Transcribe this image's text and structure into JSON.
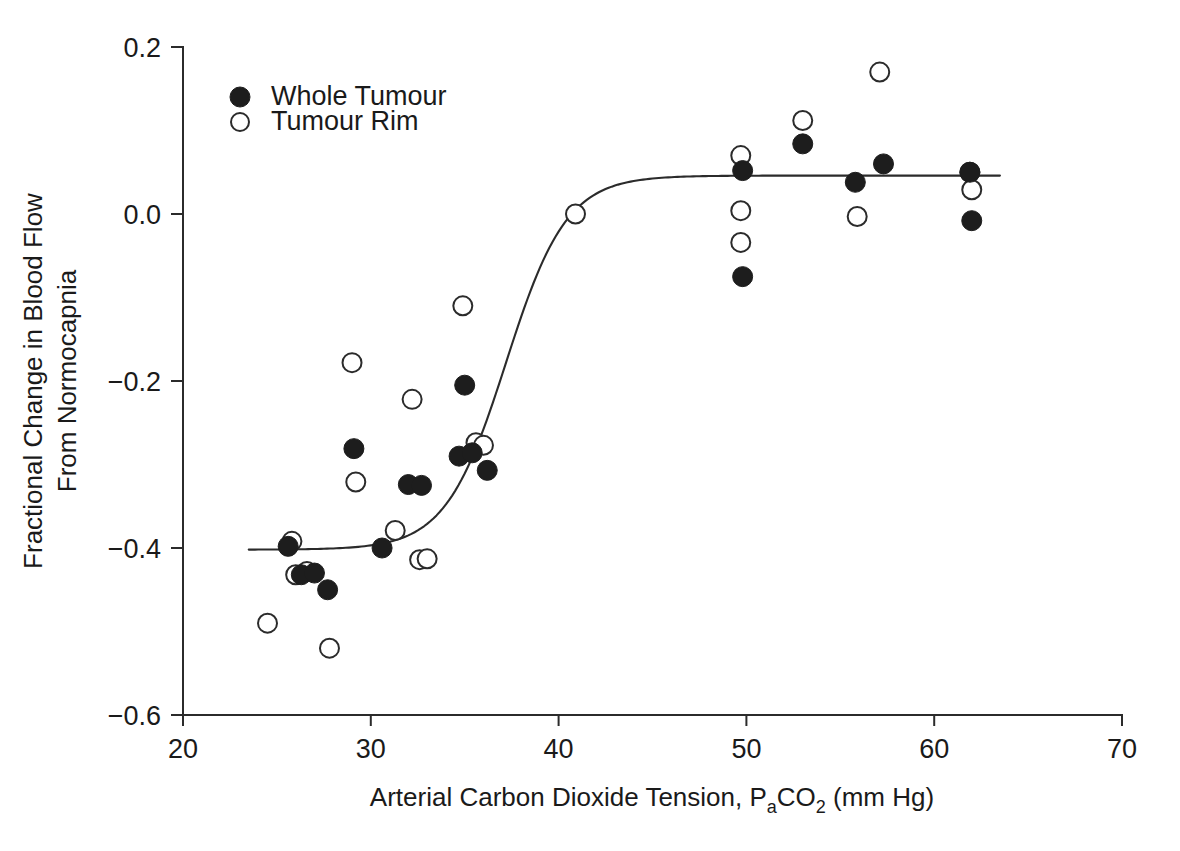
{
  "chart_data": {
    "type": "scatter",
    "title": "",
    "xlabel": "Arterial Carbon Dioxide Tension, PaCO2 (mm Hg)",
    "xlabel_parts": {
      "lead": "Arterial Carbon Dioxide Tension, P",
      "sub1": "a",
      "mid": "CO",
      "sub2": "2",
      "tail": " (mm Hg)"
    },
    "ylabel": "Fractional Change in Blood Flow From Normocapnia",
    "ylabel_line1": "Fractional Change in Blood Flow",
    "ylabel_line2": "From Normocapnia",
    "xlim": [
      20,
      70
    ],
    "ylim": [
      -0.6,
      0.2
    ],
    "xticks": [
      20,
      30,
      40,
      50,
      60,
      70
    ],
    "xtick_labels": [
      "20",
      "30",
      "40",
      "50",
      "60",
      "70"
    ],
    "yticks": [
      0.2,
      0.0,
      -0.2,
      -0.4,
      -0.6
    ],
    "ytick_labels": [
      "0.2",
      "0.0",
      "-0.2",
      "-0.4",
      "-0.6"
    ],
    "grid": false,
    "legend_position": "top-left",
    "marker_radius": 9,
    "colors": {
      "filled_marker": "#1d1d1d",
      "open_marker_stroke": "#2b2b2b",
      "open_marker_fill": "#ffffff",
      "axis": "#2b2b2b",
      "curve": "#2b2b2b",
      "background": "#ffffff"
    },
    "series": [
      {
        "name": "Whole Tumour",
        "marker": "filled-circle",
        "points": [
          [
            25.6,
            -0.398
          ],
          [
            26.3,
            -0.432
          ],
          [
            27.0,
            -0.43
          ],
          [
            27.7,
            -0.45
          ],
          [
            29.1,
            -0.281
          ],
          [
            30.6,
            -0.4
          ],
          [
            32.0,
            -0.324
          ],
          [
            32.7,
            -0.325
          ],
          [
            34.7,
            -0.29
          ],
          [
            35.0,
            -0.205
          ],
          [
            35.4,
            -0.286
          ],
          [
            36.2,
            -0.307
          ],
          [
            49.8,
            0.052
          ],
          [
            49.8,
            -0.075
          ],
          [
            53.0,
            0.084
          ],
          [
            55.8,
            0.038
          ],
          [
            57.3,
            0.06
          ],
          [
            61.9,
            0.05
          ],
          [
            62.0,
            -0.008
          ]
        ]
      },
      {
        "name": "Tumour Rim",
        "marker": "open-circle",
        "points": [
          [
            24.5,
            -0.49
          ],
          [
            25.8,
            -0.392
          ],
          [
            26.0,
            -0.432
          ],
          [
            26.6,
            -0.428
          ],
          [
            27.8,
            -0.52
          ],
          [
            29.0,
            -0.178
          ],
          [
            29.2,
            -0.321
          ],
          [
            31.3,
            -0.379
          ],
          [
            32.2,
            -0.222
          ],
          [
            32.6,
            -0.414
          ],
          [
            33.0,
            -0.413
          ],
          [
            34.9,
            -0.11
          ],
          [
            35.6,
            -0.274
          ],
          [
            36.0,
            -0.277
          ],
          [
            40.9,
            0.0
          ],
          [
            49.7,
            0.07
          ],
          [
            49.7,
            0.004
          ],
          [
            49.7,
            -0.034
          ],
          [
            53.0,
            0.112
          ],
          [
            55.9,
            -0.003
          ],
          [
            57.1,
            0.17
          ],
          [
            61.9,
            0.05
          ],
          [
            62.0,
            0.029
          ]
        ]
      }
    ],
    "fit_curve": {
      "name": "sigmoid fit",
      "lower_asymptote": -0.402,
      "upper_asymptote": 0.046,
      "midpoint_x": 37.2,
      "slope": 0.62,
      "x_start": 23.5,
      "x_end": 63.5
    }
  },
  "legend": {
    "items": [
      {
        "label": "Whole Tumour",
        "marker": "filled-circle"
      },
      {
        "label": "Tumour Rim",
        "marker": "open-circle"
      }
    ]
  }
}
